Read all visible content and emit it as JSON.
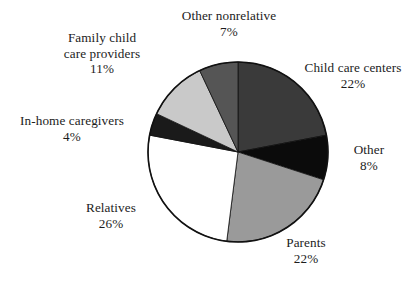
{
  "chart_data": {
    "type": "pie",
    "title": "",
    "subtitle": "",
    "xlabel": "",
    "ylabel": "",
    "legend_position": "none",
    "grid": false,
    "units": "percent",
    "start_angle_deg": 0,
    "direction": "clockwise",
    "categories": [
      "Child care centers",
      "Other",
      "Parents",
      "Relatives",
      "In-home caregivers",
      "Family child care providers",
      "Other nonrelative"
    ],
    "values": [
      22,
      8,
      22,
      26,
      4,
      11,
      7
    ],
    "value_labels": [
      "22%",
      "8%",
      "22%",
      "26%",
      "4%",
      "11%",
      "7%"
    ],
    "slice_colors": [
      "#3a3a3a",
      "#0b0b0b",
      "#9a9a9a",
      "#ffffff",
      "#1a1a1a",
      "#c9c9c9",
      "#555555"
    ],
    "outline_color": "#111111",
    "background_color": "#ffffff",
    "slices": [
      {
        "label": "Child care centers",
        "value": 22,
        "value_text": "22%",
        "color": "#3a3a3a"
      },
      {
        "label": "Other",
        "value": 8,
        "value_text": "8%",
        "color": "#0b0b0b"
      },
      {
        "label": "Parents",
        "value": 22,
        "value_text": "22%",
        "color": "#9a9a9a"
      },
      {
        "label": "Relatives",
        "value": 26,
        "value_text": "26%",
        "color": "#ffffff"
      },
      {
        "label": "In-home caregivers",
        "value": 4,
        "value_text": "4%",
        "color": "#1a1a1a"
      },
      {
        "label": "Family child care providers",
        "value": 11,
        "value_text": "11%",
        "color": "#c9c9c9"
      },
      {
        "label": "Other nonrelative",
        "value": 7,
        "value_text": "7%",
        "color": "#555555"
      }
    ]
  },
  "labels": {
    "other_nonrelative": {
      "name": "Other nonrelative",
      "value": "7%"
    },
    "child_care_centers": {
      "name": "Child care centers",
      "value": "22%"
    },
    "other": {
      "name": "Other",
      "value": "8%"
    },
    "parents": {
      "name": "Parents",
      "value": "22%"
    },
    "relatives": {
      "name": "Relatives",
      "value": "26%"
    },
    "in_home_caregivers": {
      "name": "In-home caregivers",
      "value": "4%"
    },
    "family_child_care_providers": {
      "name_line1": "Family child",
      "name_line2": "care providers",
      "value": "11%"
    }
  }
}
